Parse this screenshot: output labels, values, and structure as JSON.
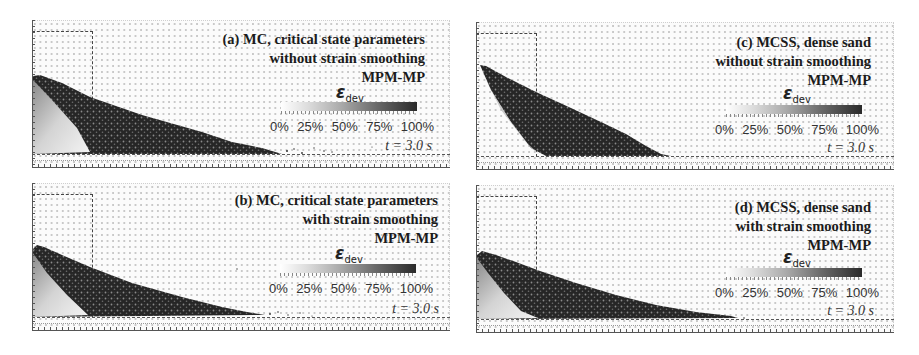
{
  "figure": {
    "colorbar": {
      "symbol": "ε",
      "subscript": "dev",
      "ticks": [
        "0%",
        "25%",
        "50%",
        "75%",
        "100%"
      ],
      "gradient_colors": [
        "#ffffff",
        "#2a2a2a"
      ]
    },
    "panels": [
      {
        "id": "a",
        "title_lines": [
          "(a) MC, critical state parameters",
          "without strain smoothing",
          "MPM-MP"
        ],
        "time_label": "t = 3.0 s"
      },
      {
        "id": "b",
        "title_lines": [
          "(b) MC, critical state parameters",
          "with strain smoothing",
          "MPM-MP"
        ],
        "time_label": "t = 3.0 s"
      },
      {
        "id": "c",
        "title_lines": [
          "(c) MCSS, dense sand",
          "without strain smoothing",
          "MPM-MP"
        ],
        "time_label": "t = 3.0 s"
      },
      {
        "id": "d",
        "title_lines": [
          "(d) MCSS, dense sand",
          "with strain smoothing",
          "MPM-MP"
        ],
        "time_label": "t = 3.0 s"
      }
    ]
  }
}
